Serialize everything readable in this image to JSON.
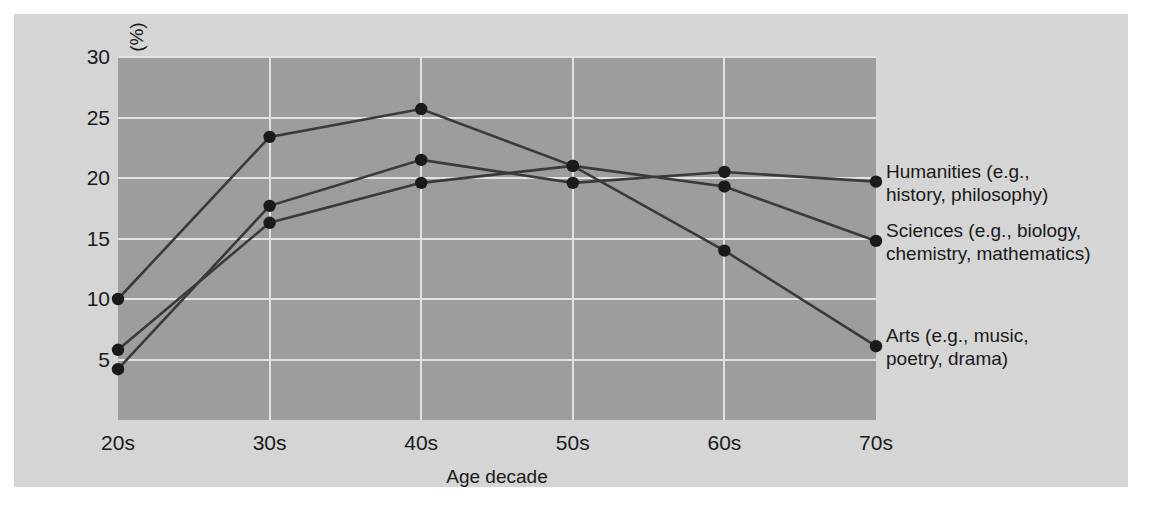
{
  "chart_data": {
    "type": "line",
    "title": "",
    "xlabel": "Age decade",
    "ylabel": "Works completed in each decade (%)",
    "categories": [
      "20s",
      "30s",
      "40s",
      "50s",
      "60s",
      "70s"
    ],
    "x_tick_labels": [
      "20s",
      "30s",
      "40s",
      "50s",
      "60s",
      "70s"
    ],
    "y_tick_labels": [
      "30",
      "25",
      "20",
      "15",
      "10",
      "5"
    ],
    "y_ticks": [
      30,
      25,
      20,
      15,
      10,
      5
    ],
    "ylim": [
      0,
      30
    ],
    "grid": true,
    "legend_position": "right-inline-labels",
    "series": [
      {
        "name": "Humanities (e.g.,\nhistory, philosophy)",
        "short_name": "Humanities",
        "values": [
          4.2,
          17.7,
          21.5,
          19.6,
          20.5,
          19.7
        ],
        "color": "#3a3a3a"
      },
      {
        "name": "Sciences (e.g., biology,\nchemistry, mathematics)",
        "short_name": "Sciences",
        "values": [
          5.8,
          16.3,
          19.6,
          21.0,
          19.3,
          14.8
        ],
        "color": "#3a3a3a"
      },
      {
        "name": "Arts (e.g., music,\npoetry, drama)",
        "short_name": "Arts",
        "values": [
          10.0,
          23.4,
          25.7,
          21.0,
          14.0,
          6.1
        ],
        "color": "#3a3a3a"
      }
    ]
  },
  "figure": {
    "background_color": "#d5d5d5",
    "plot_background_color": "#9d9d9d",
    "gridline_color": "#e2e2e2",
    "marker_color": "#1a1a1a",
    "line_color": "#3a3a3a"
  },
  "series_labels": [
    {
      "line1": "Humanities (e.g.,",
      "line2": "history, philosophy)"
    },
    {
      "line1": "Sciences (e.g., biology,",
      "line2": "chemistry, mathematics)"
    },
    {
      "line1": "Arts (e.g., music,",
      "line2": "poetry, drama)"
    }
  ]
}
